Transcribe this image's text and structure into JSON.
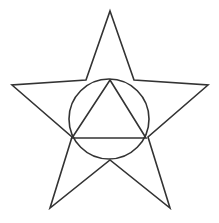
{
  "figure": {
    "title": "Pentagram with inscribed circle and equilateral triangle",
    "background_color": "#ffffff",
    "stroke_color": "#333333",
    "stroke_width": 1.6,
    "width": 219,
    "height": 223,
    "shapes": [
      {
        "name": "five-pointed-star",
        "type": "polygon",
        "points": "110,11 134,80 208,85 148,137 170,208 110,160 50,208 72,137 12,85 86,80",
        "description": "Outline five-pointed star (pentagram outline) spanning the full frame"
      },
      {
        "name": "inscribed-circle",
        "type": "circle",
        "cx": 109,
        "cy": 119,
        "r": 40,
        "description": "Circle centered in the star body passing through the triangle vertices"
      },
      {
        "name": "inscribed-triangle",
        "type": "polygon",
        "points": "110,80 146,138 72,138",
        "description": "Equilateral triangle inscribed in the circle, apex at top"
      }
    ]
  }
}
